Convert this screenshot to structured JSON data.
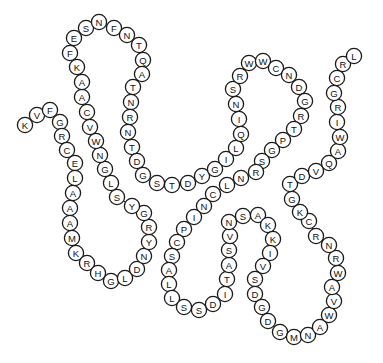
{
  "diagram": {
    "type": "protein-sequence-bead-diagram",
    "bead_radius": 7.6,
    "stroke_color": "#1a1a1a",
    "fill_color": "#ffffff",
    "sequence": "KVFGRCELAAAMKRHGLDNYRGYSLGNWVCAAKFESNFNTQATNRNTDGSTDYGILQINSRWWCNDGRTPGSRNLCNIPCSALLSSDITASVNSAKKIVSDGDGMNAWVAWRNRCKGTDVQAWIRGCRL",
    "beads": [
      {
        "aa": "K",
        "x": 25,
        "y": 125
      },
      {
        "aa": "V",
        "x": 37,
        "y": 115
      },
      {
        "aa": "F",
        "x": 50,
        "y": 110
      },
      {
        "aa": "G",
        "x": 60,
        "y": 122
      },
      {
        "aa": "R",
        "x": 62,
        "y": 136
      },
      {
        "aa": "C",
        "x": 67,
        "y": 150
      },
      {
        "aa": "E",
        "x": 75,
        "y": 163
      },
      {
        "aa": "L",
        "x": 75,
        "y": 178
      },
      {
        "aa": "A",
        "x": 73,
        "y": 193
      },
      {
        "aa": "A",
        "x": 70,
        "y": 208
      },
      {
        "aa": "A",
        "x": 70,
        "y": 223
      },
      {
        "aa": "M",
        "x": 72,
        "y": 238
      },
      {
        "aa": "K",
        "x": 76,
        "y": 253
      },
      {
        "aa": "R",
        "x": 87,
        "y": 263
      },
      {
        "aa": "H",
        "x": 98,
        "y": 273
      },
      {
        "aa": "G",
        "x": 111,
        "y": 281
      },
      {
        "aa": "L",
        "x": 125,
        "y": 278
      },
      {
        "aa": "D",
        "x": 137,
        "y": 269
      },
      {
        "aa": "N",
        "x": 144,
        "y": 256
      },
      {
        "aa": "Y",
        "x": 149,
        "y": 242
      },
      {
        "aa": "R",
        "x": 149,
        "y": 227
      },
      {
        "aa": "G",
        "x": 144,
        "y": 213
      },
      {
        "aa": "Y",
        "x": 132,
        "y": 206
      },
      {
        "aa": "S",
        "x": 117,
        "y": 197
      },
      {
        "aa": "L",
        "x": 111,
        "y": 183
      },
      {
        "aa": "G",
        "x": 105,
        "y": 169
      },
      {
        "aa": "N",
        "x": 100,
        "y": 155
      },
      {
        "aa": "W",
        "x": 96,
        "y": 141
      },
      {
        "aa": "V",
        "x": 90,
        "y": 127
      },
      {
        "aa": "C",
        "x": 87,
        "y": 112
      },
      {
        "aa": "A",
        "x": 82,
        "y": 97
      },
      {
        "aa": "A",
        "x": 82,
        "y": 82
      },
      {
        "aa": "K",
        "x": 77,
        "y": 67
      },
      {
        "aa": "F",
        "x": 70,
        "y": 53
      },
      {
        "aa": "E",
        "x": 74,
        "y": 38
      },
      {
        "aa": "S",
        "x": 86,
        "y": 28
      },
      {
        "aa": "N",
        "x": 99,
        "y": 22
      },
      {
        "aa": "F",
        "x": 114,
        "y": 28
      },
      {
        "aa": "N",
        "x": 127,
        "y": 35
      },
      {
        "aa": "T",
        "x": 139,
        "y": 45
      },
      {
        "aa": "Q",
        "x": 143,
        "y": 60
      },
      {
        "aa": "A",
        "x": 142,
        "y": 74
      },
      {
        "aa": "T",
        "x": 133,
        "y": 87
      },
      {
        "aa": "N",
        "x": 131,
        "y": 102
      },
      {
        "aa": "R",
        "x": 130,
        "y": 117
      },
      {
        "aa": "N",
        "x": 128,
        "y": 132
      },
      {
        "aa": "T",
        "x": 132,
        "y": 147
      },
      {
        "aa": "D",
        "x": 137,
        "y": 161
      },
      {
        "aa": "G",
        "x": 143,
        "y": 175
      },
      {
        "aa": "S",
        "x": 157,
        "y": 183
      },
      {
        "aa": "T",
        "x": 172,
        "y": 185
      },
      {
        "aa": "D",
        "x": 188,
        "y": 183
      },
      {
        "aa": "Y",
        "x": 202,
        "y": 176
      },
      {
        "aa": "G",
        "x": 215,
        "y": 169
      },
      {
        "aa": "I",
        "x": 226,
        "y": 159
      },
      {
        "aa": "L",
        "x": 236,
        "y": 148
      },
      {
        "aa": "Q",
        "x": 241,
        "y": 134
      },
      {
        "aa": "I",
        "x": 239,
        "y": 119
      },
      {
        "aa": "N",
        "x": 236,
        "y": 104
      },
      {
        "aa": "S",
        "x": 233,
        "y": 89
      },
      {
        "aa": "R",
        "x": 240,
        "y": 76
      },
      {
        "aa": "W",
        "x": 249,
        "y": 63
      },
      {
        "aa": "W",
        "x": 263,
        "y": 61
      },
      {
        "aa": "C",
        "x": 276,
        "y": 68
      },
      {
        "aa": "N",
        "x": 289,
        "y": 75
      },
      {
        "aa": "D",
        "x": 299,
        "y": 87
      },
      {
        "aa": "G",
        "x": 305,
        "y": 101
      },
      {
        "aa": "R",
        "x": 301,
        "y": 116
      },
      {
        "aa": "T",
        "x": 294,
        "y": 129
      },
      {
        "aa": "P",
        "x": 283,
        "y": 140
      },
      {
        "aa": "G",
        "x": 272,
        "y": 150
      },
      {
        "aa": "S",
        "x": 262,
        "y": 161
      },
      {
        "aa": "R",
        "x": 256,
        "y": 172
      },
      {
        "aa": "N",
        "x": 241,
        "y": 178
      },
      {
        "aa": "L",
        "x": 227,
        "y": 185
      },
      {
        "aa": "C",
        "x": 213,
        "y": 194
      },
      {
        "aa": "N",
        "x": 204,
        "y": 206
      },
      {
        "aa": "I",
        "x": 194,
        "y": 217
      },
      {
        "aa": "P",
        "x": 184,
        "y": 229
      },
      {
        "aa": "C",
        "x": 177,
        "y": 242
      },
      {
        "aa": "S",
        "x": 172,
        "y": 256
      },
      {
        "aa": "A",
        "x": 169,
        "y": 270
      },
      {
        "aa": "L",
        "x": 169,
        "y": 284
      },
      {
        "aa": "L",
        "x": 172,
        "y": 298
      },
      {
        "aa": "S",
        "x": 184,
        "y": 307
      },
      {
        "aa": "S",
        "x": 199,
        "y": 310
      },
      {
        "aa": "D",
        "x": 213,
        "y": 304
      },
      {
        "aa": "I",
        "x": 225,
        "y": 294
      },
      {
        "aa": "T",
        "x": 227,
        "y": 279
      },
      {
        "aa": "A",
        "x": 229,
        "y": 265
      },
      {
        "aa": "S",
        "x": 229,
        "y": 250
      },
      {
        "aa": "V",
        "x": 230,
        "y": 236
      },
      {
        "aa": "N",
        "x": 229,
        "y": 222
      },
      {
        "aa": "S",
        "x": 243,
        "y": 216
      },
      {
        "aa": "A",
        "x": 258,
        "y": 215
      },
      {
        "aa": "K",
        "x": 268,
        "y": 225
      },
      {
        "aa": "K",
        "x": 273,
        "y": 239
      },
      {
        "aa": "I",
        "x": 270,
        "y": 253
      },
      {
        "aa": "V",
        "x": 263,
        "y": 266
      },
      {
        "aa": "S",
        "x": 255,
        "y": 279
      },
      {
        "aa": "D",
        "x": 255,
        "y": 294
      },
      {
        "aa": "G",
        "x": 262,
        "y": 307
      },
      {
        "aa": "D",
        "x": 268,
        "y": 321
      },
      {
        "aa": "G",
        "x": 280,
        "y": 332
      },
      {
        "aa": "M",
        "x": 294,
        "y": 337
      },
      {
        "aa": "N",
        "x": 308,
        "y": 335
      },
      {
        "aa": "A",
        "x": 320,
        "y": 327
      },
      {
        "aa": "W",
        "x": 329,
        "y": 315
      },
      {
        "aa": "V",
        "x": 334,
        "y": 301
      },
      {
        "aa": "A",
        "x": 332,
        "y": 287
      },
      {
        "aa": "W",
        "x": 338,
        "y": 273
      },
      {
        "aa": "R",
        "x": 336,
        "y": 258
      },
      {
        "aa": "N",
        "x": 329,
        "y": 245
      },
      {
        "aa": "R",
        "x": 316,
        "y": 236
      },
      {
        "aa": "C",
        "x": 309,
        "y": 221
      },
      {
        "aa": "K",
        "x": 300,
        "y": 212
      },
      {
        "aa": "G",
        "x": 292,
        "y": 199
      },
      {
        "aa": "T",
        "x": 290,
        "y": 184
      },
      {
        "aa": "D",
        "x": 302,
        "y": 176
      },
      {
        "aa": "V",
        "x": 316,
        "y": 171
      },
      {
        "aa": "Q",
        "x": 329,
        "y": 163
      },
      {
        "aa": "A",
        "x": 338,
        "y": 151
      },
      {
        "aa": "W",
        "x": 340,
        "y": 137
      },
      {
        "aa": "I",
        "x": 337,
        "y": 122
      },
      {
        "aa": "R",
        "x": 338,
        "y": 107
      },
      {
        "aa": "G",
        "x": 334,
        "y": 93
      },
      {
        "aa": "C",
        "x": 337,
        "y": 78
      },
      {
        "aa": "R",
        "x": 343,
        "y": 64
      },
      {
        "aa": "L",
        "x": 354,
        "y": 56
      }
    ]
  }
}
